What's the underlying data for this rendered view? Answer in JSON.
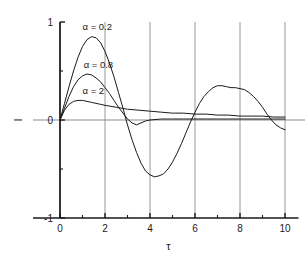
{
  "chart_data": {
    "type": "line",
    "title": "",
    "xlabel": "τ",
    "ylabel": "I",
    "xlim": [
      -1,
      11
    ],
    "ylim": [
      -1,
      1
    ],
    "grid": "vertical",
    "legend_position": "inline-annotations",
    "xticks": [
      0,
      2,
      4,
      6,
      8,
      10
    ],
    "xtick_labels": [
      "0",
      "2",
      "4",
      "6",
      "8",
      "10"
    ],
    "xminor_ticks": [
      1,
      3,
      5,
      7,
      9
    ],
    "yticks": [
      -1,
      0,
      1
    ],
    "ytick_labels": [
      "-1",
      "0",
      "1"
    ],
    "yminor_ticks": [
      -0.5,
      0.5
    ],
    "annotations": [
      {
        "text": "α = 0.2",
        "x": 1.0,
        "y": 0.92
      },
      {
        "text": "α = 0.8",
        "x": 1.05,
        "y": 0.53
      },
      {
        "text": "α = 2",
        "x": 1.0,
        "y": 0.27
      }
    ],
    "series": [
      {
        "name": "α = 0.2",
        "color": "#1a1a1a",
        "x": [
          0.0,
          0.2,
          0.4,
          0.6,
          0.8,
          1.0,
          1.2,
          1.4,
          1.6,
          1.8,
          2.0,
          2.2,
          2.4,
          2.6,
          2.8,
          3.0,
          3.2,
          3.4,
          3.6,
          3.8,
          4.0,
          4.2,
          4.4,
          4.6,
          4.8,
          5.0,
          5.2,
          5.4,
          5.6,
          5.8,
          6.0,
          6.2,
          6.4,
          6.6,
          6.8,
          7.0,
          7.2,
          7.4,
          7.6,
          7.8,
          8.0,
          8.2,
          8.4,
          8.6,
          8.8,
          9.0,
          9.2,
          9.4,
          9.6,
          9.8,
          10.0
        ],
        "y": [
          0.0,
          0.17,
          0.34,
          0.5,
          0.64,
          0.75,
          0.82,
          0.85,
          0.84,
          0.79,
          0.7,
          0.58,
          0.44,
          0.28,
          0.12,
          -0.05,
          -0.2,
          -0.33,
          -0.44,
          -0.52,
          -0.56,
          -0.58,
          -0.57,
          -0.55,
          -0.5,
          -0.43,
          -0.34,
          -0.24,
          -0.13,
          -0.02,
          0.08,
          0.17,
          0.24,
          0.29,
          0.33,
          0.35,
          0.35,
          0.34,
          0.33,
          0.33,
          0.32,
          0.31,
          0.28,
          0.24,
          0.19,
          0.13,
          0.06,
          -0.0,
          -0.05,
          -0.08,
          -0.1
        ]
      },
      {
        "name": "α = 0.8",
        "color": "#1a1a1a",
        "x": [
          0.0,
          0.2,
          0.4,
          0.6,
          0.8,
          1.0,
          1.2,
          1.4,
          1.6,
          1.8,
          2.0,
          2.2,
          2.4,
          2.6,
          2.8,
          3.0,
          3.2,
          3.4,
          3.6,
          3.8,
          4.0,
          4.5,
          5.0,
          5.5,
          6.0,
          6.5,
          7.0,
          7.5,
          8.0,
          8.5,
          9.0,
          9.5,
          10.0
        ],
        "y": [
          0.0,
          0.12,
          0.24,
          0.34,
          0.41,
          0.45,
          0.47,
          0.46,
          0.43,
          0.39,
          0.33,
          0.27,
          0.2,
          0.13,
          0.07,
          0.01,
          -0.03,
          -0.05,
          -0.03,
          -0.01,
          0.0,
          0.01,
          0.01,
          0.01,
          0.01,
          0.01,
          0.01,
          0.01,
          0.01,
          0.01,
          0.01,
          0.01,
          0.01
        ]
      },
      {
        "name": "α = 2",
        "color": "#1a1a1a",
        "x": [
          0.0,
          0.2,
          0.4,
          0.6,
          0.8,
          1.0,
          1.2,
          1.4,
          1.6,
          1.8,
          2.0,
          2.5,
          3.0,
          3.5,
          4.0,
          4.5,
          5.0,
          5.5,
          6.0,
          6.5,
          7.0,
          7.5,
          8.0,
          8.5,
          9.0,
          9.5,
          10.0
        ],
        "y": [
          0.0,
          0.1,
          0.16,
          0.19,
          0.2,
          0.2,
          0.19,
          0.18,
          0.17,
          0.16,
          0.15,
          0.13,
          0.11,
          0.1,
          0.09,
          0.08,
          0.07,
          0.07,
          0.06,
          0.06,
          0.05,
          0.05,
          0.04,
          0.04,
          0.04,
          0.03,
          0.03
        ]
      }
    ]
  },
  "colors": {
    "axis": "#1a1a1a",
    "grid": "#8c8c8c",
    "zero_line": "#8c8c8c",
    "curve": "#1a1a1a",
    "background": "#ffffff"
  }
}
